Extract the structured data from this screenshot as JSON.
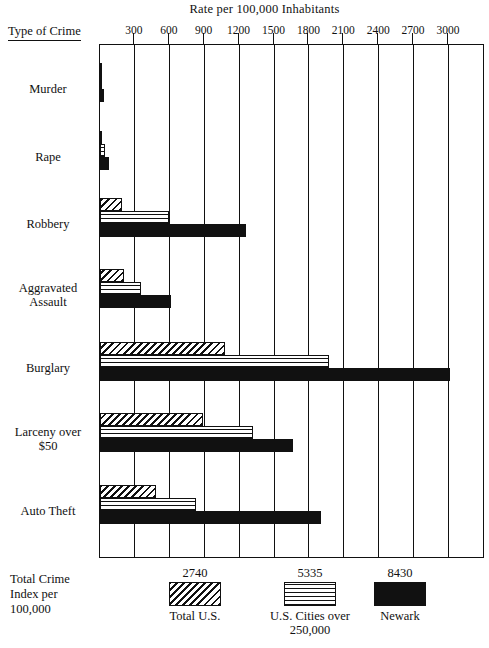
{
  "chart_data": {
    "type": "bar",
    "orientation": "horizontal",
    "title": "Rate per 100,000 Inhabitants",
    "xlabel": "Rate per 100,000 Inhabitants",
    "ylabel": "Type of Crime",
    "corner_label": "Type of Crime",
    "xlim": [
      0,
      3000
    ],
    "xticks": [
      300,
      600,
      900,
      1200,
      1500,
      1800,
      2100,
      2400,
      2700,
      3000
    ],
    "grid": true,
    "legend_position": "bottom",
    "categories": [
      "Murder",
      "Rape",
      "Robbery",
      "Aggravated Assault",
      "Burglary",
      "Larceny over $50",
      "Auto Theft"
    ],
    "category_label_lines": [
      [
        "Murder"
      ],
      [
        "Rape"
      ],
      [
        "Robbery"
      ],
      [
        "Aggravated",
        "Assault"
      ],
      [
        "Burglary"
      ],
      [
        "Larceny over",
        "$50"
      ],
      [
        "Auto Theft"
      ]
    ],
    "series": [
      {
        "name": "Total U.S.",
        "pattern": "diagonal-hatch",
        "total_crime_index": "2740",
        "values": [
          9,
          19,
          190,
          205,
          1075,
          885,
          480
        ]
      },
      {
        "name": "U.S. Cities over 250,000",
        "pattern": "cross-hatch",
        "total_crime_index": "5335",
        "values": [
          20,
          44,
          590,
          355,
          1970,
          1315,
          825
        ]
      },
      {
        "name": "Newark",
        "pattern": "solid-black",
        "total_crime_index": "8430",
        "values": [
          37,
          75,
          1255,
          610,
          3010,
          1660,
          1900
        ]
      }
    ]
  },
  "legend": {
    "row_label_lines": [
      "Total Crime",
      "Index per",
      "100,000"
    ],
    "entries": [
      {
        "value": "2740",
        "name": "Total U.S.",
        "name_lines": [
          "Total U.S."
        ]
      },
      {
        "value": "5335",
        "name": "U.S. Cities over 250,000",
        "name_lines": [
          "U.S. Cities over",
          "250,000"
        ]
      },
      {
        "value": "8430",
        "name": "Newark",
        "name_lines": [
          "Newark"
        ]
      }
    ]
  },
  "colors": {
    "ink": "#111111",
    "paper": "#ffffff"
  }
}
